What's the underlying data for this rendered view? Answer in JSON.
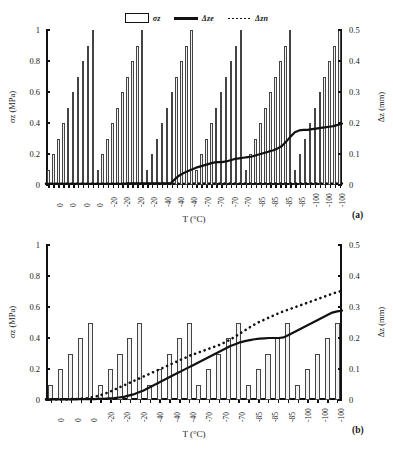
{
  "legend": {
    "entries": [
      {
        "name": "stress-bar",
        "label": "σz",
        "style": "bar"
      },
      {
        "name": "delta-ze-line",
        "label": "Δze",
        "style": "solid"
      },
      {
        "name": "delta-zn-line",
        "label": "Δzn",
        "style": "dotted"
      }
    ]
  },
  "colors": {
    "axis": "#111111",
    "bar_fill": "#f2f2f2",
    "bar_edge": "#444444",
    "line": "#111111",
    "background": "#ffffff"
  },
  "panels": [
    {
      "tag": "(a)"
    },
    {
      "tag": "(b)"
    }
  ],
  "chart_data": [
    {
      "id": "panel-a",
      "type": "bar",
      "title": "",
      "panel_tag": "(a)",
      "xlabel": "T (°C)",
      "ylabel": "σz (MPa)",
      "y2label": "Δz (mm)",
      "ylim": [
        0,
        1
      ],
      "y2lim": [
        0,
        0.5
      ],
      "yticks": [
        "0",
        "0.2",
        "0.4",
        "0.6",
        "0.8",
        "1"
      ],
      "ytick_values": [
        0,
        0.2,
        0.4,
        0.6,
        0.8,
        1
      ],
      "y2ticks": [
        "0",
        "0.1",
        "0.2",
        "0.3",
        "0.4",
        "0.5"
      ],
      "y2tick_values": [
        0,
        0.1,
        0.2,
        0.3,
        0.4,
        0.5
      ],
      "grid": false,
      "legend_position": "top-center",
      "xtick_labels": [
        "0",
        "0",
        "0",
        "0",
        "-20",
        "-20",
        "-20",
        "-20",
        "-40",
        "-40",
        "-40",
        "-70",
        "-70",
        "-70",
        "-70",
        "-85",
        "-85",
        "-85",
        "-85",
        "-100",
        "-100",
        "-100"
      ],
      "temperature_groups": [
        0,
        -20,
        -40,
        -70,
        -85,
        -100
      ],
      "bars_per_group": 10,
      "group_bar_values": [
        0.1,
        0.2,
        0.3,
        0.4,
        0.5,
        0.6,
        0.7,
        0.8,
        0.9,
        1.0
      ],
      "values": [
        0.1,
        0.2,
        0.3,
        0.4,
        0.5,
        0.6,
        0.7,
        0.8,
        0.9,
        1.0,
        0.1,
        0.2,
        0.3,
        0.4,
        0.5,
        0.6,
        0.7,
        0.8,
        0.9,
        1.0,
        0.1,
        0.2,
        0.3,
        0.4,
        0.5,
        0.6,
        0.7,
        0.8,
        0.9,
        1.0,
        0.1,
        0.2,
        0.3,
        0.4,
        0.5,
        0.6,
        0.7,
        0.8,
        0.9,
        1.0,
        0.1,
        0.2,
        0.3,
        0.4,
        0.5,
        0.6,
        0.7,
        0.8,
        0.9,
        1.0,
        0.1,
        0.2,
        0.3,
        0.4,
        0.5,
        0.6,
        0.7,
        0.8,
        0.9,
        1.0
      ],
      "series": [
        {
          "name": "Δze",
          "style": "solid",
          "axis": "right",
          "values": [
            0.004,
            0.004,
            0.004,
            0.004,
            0.004,
            0.004,
            0.004,
            0.004,
            0.004,
            0.004,
            0.004,
            0.004,
            0.004,
            0.004,
            0.004,
            0.004,
            0.004,
            0.004,
            0.004,
            0.005,
            0.005,
            0.005,
            0.005,
            0.005,
            0.005,
            0.005,
            0.005,
            0.005,
            0.005,
            0.005,
            0.018,
            0.03,
            0.038,
            0.044,
            0.05,
            0.056,
            0.06,
            0.064,
            0.068,
            0.072,
            0.074,
            0.074,
            0.076,
            0.08,
            0.084,
            0.086,
            0.088,
            0.09,
            0.092,
            0.096,
            0.1,
            0.104,
            0.108,
            0.112,
            0.118,
            0.126,
            0.14,
            0.156,
            0.17,
            0.176,
            0.178,
            0.178,
            0.18,
            0.182,
            0.184,
            0.186,
            0.188,
            0.19,
            0.194,
            0.198
          ]
        },
        {
          "name": "Δzn",
          "style": "dotted",
          "axis": "right",
          "values": [
            0.004,
            0.004,
            0.004,
            0.004,
            0.004,
            0.004,
            0.004,
            0.004,
            0.004,
            0.004,
            0.004,
            0.004,
            0.004,
            0.004,
            0.004,
            0.004,
            0.004,
            0.004,
            0.004,
            0.004,
            0.005,
            0.005,
            0.005,
            0.005,
            0.005,
            0.005,
            0.005,
            0.005,
            0.005,
            0.005,
            0.005,
            0.005,
            0.005,
            0.005,
            0.005,
            0.005,
            0.005,
            0.005,
            0.005,
            0.005
          ]
        }
      ]
    },
    {
      "id": "panel-b",
      "type": "bar",
      "title": "",
      "panel_tag": "(b)",
      "xlabel": "T (°C)",
      "ylabel": "σz (MPa)",
      "y2label": "Δz (mm)",
      "ylim": [
        0,
        1
      ],
      "y2lim": [
        0,
        0.5
      ],
      "yticks": [
        "0",
        "0.2",
        "0.4",
        "0.6",
        "0.8",
        "1"
      ],
      "ytick_values": [
        0,
        0.2,
        0.4,
        0.6,
        0.8,
        1
      ],
      "y2ticks": [
        "0",
        "0.1",
        "0.2",
        "0.3",
        "0.4",
        "0.5"
      ],
      "y2tick_values": [
        0,
        0.1,
        0.2,
        0.3,
        0.4,
        0.5
      ],
      "grid": false,
      "legend_position": "shared-top",
      "xtick_labels": [
        "0",
        "0",
        "0",
        "-20",
        "-20",
        "-20",
        "-40",
        "-40",
        "-40",
        "-70",
        "-70",
        "-70",
        "-85",
        "-85",
        "-85",
        "-100",
        "-100",
        "-100"
      ],
      "temperature_groups": [
        0,
        -20,
        -40,
        -70,
        -85,
        -100
      ],
      "bars_per_group": 5,
      "group_bar_values": [
        0.1,
        0.2,
        0.3,
        0.4,
        0.5
      ],
      "values": [
        0.1,
        0.2,
        0.3,
        0.4,
        0.5,
        0.1,
        0.2,
        0.3,
        0.4,
        0.5,
        0.1,
        0.2,
        0.3,
        0.4,
        0.5,
        0.1,
        0.2,
        0.3,
        0.4,
        0.5,
        0.1,
        0.2,
        0.3,
        0.4,
        0.5,
        0.1,
        0.2,
        0.3,
        0.4,
        0.5
      ],
      "series": [
        {
          "name": "Δze",
          "style": "solid",
          "axis": "right",
          "values": [
            0.002,
            0.002,
            0.002,
            0.002,
            0.002,
            0.002,
            0.002,
            0.003,
            0.003,
            0.003,
            0.003,
            0.004,
            0.004,
            0.005,
            0.006,
            0.008,
            0.01,
            0.014,
            0.018,
            0.024,
            0.03,
            0.038,
            0.046,
            0.054,
            0.062,
            0.07,
            0.078,
            0.086,
            0.094,
            0.102,
            0.11,
            0.118,
            0.126,
            0.134,
            0.142,
            0.15,
            0.158,
            0.166,
            0.174,
            0.18,
            0.186,
            0.19,
            0.193,
            0.196,
            0.198,
            0.199,
            0.2,
            0.2,
            0.2,
            0.202,
            0.21,
            0.218,
            0.226,
            0.234,
            0.242,
            0.25,
            0.258,
            0.266,
            0.274,
            0.282,
            0.286,
            0.288
          ]
        },
        {
          "name": "Δzn",
          "style": "dotted",
          "axis": "right",
          "values": [
            0.002,
            0.002,
            0.002,
            0.002,
            0.003,
            0.004,
            0.006,
            0.01,
            0.016,
            0.024,
            0.034,
            0.044,
            0.054,
            0.064,
            0.074,
            0.084,
            0.094,
            0.104,
            0.114,
            0.124,
            0.134,
            0.144,
            0.152,
            0.16,
            0.168,
            0.176,
            0.186,
            0.198,
            0.212,
            0.226,
            0.24,
            0.252,
            0.262,
            0.272,
            0.282,
            0.29,
            0.298,
            0.306,
            0.314,
            0.322,
            0.33,
            0.338,
            0.346,
            0.352
          ]
        }
      ]
    }
  ]
}
